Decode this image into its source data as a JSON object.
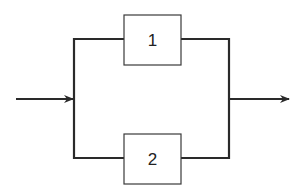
{
  "diagram": {
    "type": "parallel-block-diagram",
    "blocks": [
      {
        "id": "block-1",
        "label": "1",
        "x": 124,
        "y": 15,
        "w": 57,
        "h": 50
      },
      {
        "id": "block-2",
        "label": "2",
        "x": 124,
        "y": 134,
        "w": 57,
        "h": 50
      }
    ],
    "input": {
      "from": [
        16,
        99
      ],
      "to": [
        74,
        99
      ]
    },
    "output": {
      "from": [
        229,
        99
      ],
      "to": [
        290,
        99
      ]
    },
    "colors": {
      "line": "#2a2a2a",
      "block_border": "#3a3a3a",
      "background": "#ffffff"
    }
  }
}
